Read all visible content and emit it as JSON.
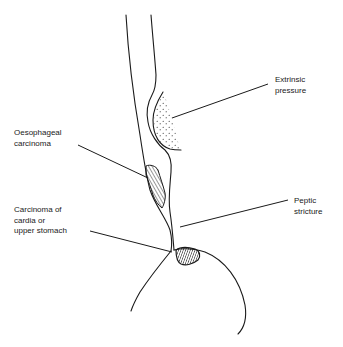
{
  "figure": {
    "type": "anatomical-line-drawing",
    "stroke_color": "#1a1a1a",
    "background_color": "#ffffff"
  },
  "labels": {
    "extrinsic_pressure": {
      "lines": [
        "Extrinsic",
        "pressure"
      ]
    },
    "oesophageal_carcinoma": {
      "lines": [
        "Oesophageal",
        "carcinoma"
      ]
    },
    "peptic_stricture": {
      "lines": [
        "Peptic",
        "stricture"
      ]
    },
    "carcinoma_cardia": {
      "lines": [
        "Carcinoma of",
        "cardia or",
        "upper stomach"
      ]
    }
  },
  "regions": [
    {
      "name": "extrinsic-pressure-mass",
      "fill": "stippled"
    },
    {
      "name": "oesophageal-carcinoma-lesion",
      "fill": "hatched"
    },
    {
      "name": "cardia-carcinoma-lesion",
      "fill": "dense-hatched"
    }
  ]
}
